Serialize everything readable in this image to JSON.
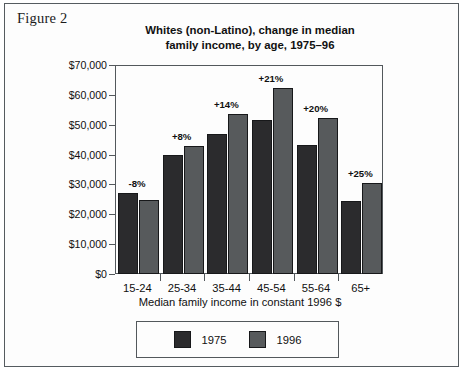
{
  "figure": {
    "caption": "Figure 2"
  },
  "chart_data": {
    "type": "bar",
    "title": "Whites (non-Latino), change in median family income, by age, 1975–96",
    "title_line1": "Whites (non-Latino), change in median",
    "title_line2": "family income, by age, 1975–96",
    "xlabel": "Median family income in constant 1996 $",
    "ylabel": "",
    "categories": [
      "15-24",
      "25-34",
      "35-44",
      "45-54",
      "55-64",
      "65+"
    ],
    "series": [
      {
        "name": "1975",
        "color": "#2b2b2d",
        "values": [
          27000,
          39700,
          46800,
          51500,
          43300,
          24400
        ]
      },
      {
        "name": "1996",
        "color": "#575a5c",
        "values": [
          24900,
          42800,
          53600,
          62200,
          52100,
          30400
        ]
      }
    ],
    "annotations": [
      "-8%",
      "+8%",
      "+14%",
      "+21%",
      "+20%",
      "+25%"
    ],
    "ylim": [
      0,
      70000
    ],
    "yticks": [
      0,
      10000,
      20000,
      30000,
      40000,
      50000,
      60000,
      70000
    ],
    "ytick_labels": [
      "$0",
      "$10,000",
      "$20,000",
      "$30,000",
      "$40,000",
      "$50,000",
      "$60,000",
      "$70,000"
    ],
    "grid": false,
    "legend": {
      "position": "bottom",
      "entries": [
        "1975",
        "1996"
      ]
    }
  }
}
